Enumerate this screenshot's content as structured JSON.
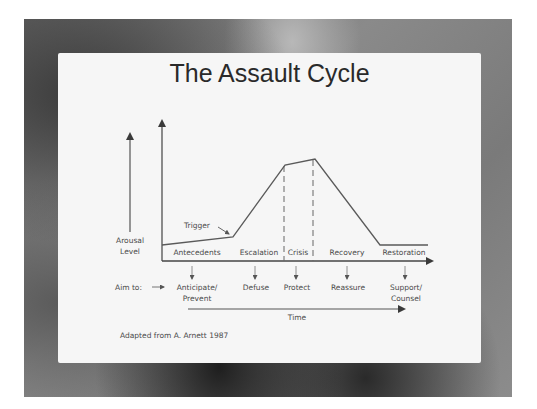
{
  "slide": {
    "title": "The Assault Cycle",
    "source_note": "Adapted from A. Arnett 1987"
  },
  "diagram": {
    "y_axis_label_line1": "Arousal",
    "y_axis_label_line2": "Level",
    "trigger_label": "Trigger",
    "phases": [
      "Antecedents",
      "Escalation",
      "Crisis",
      "Recovery",
      "Restoration"
    ],
    "aim_label": "Aim to:",
    "aims": [
      {
        "line1": "Anticipate/",
        "line2": "Prevent"
      },
      {
        "line1": "Defuse",
        "line2": ""
      },
      {
        "line1": "Protect",
        "line2": ""
      },
      {
        "line1": "Reassure",
        "line2": ""
      },
      {
        "line1": "Support/",
        "line2": "Counsel"
      }
    ],
    "time_label": "Time",
    "curve_points": [
      [
        162,
        245
      ],
      [
        233,
        237
      ],
      [
        285,
        165
      ],
      [
        315,
        159
      ],
      [
        380,
        245
      ],
      [
        428,
        245
      ]
    ],
    "colors": {
      "line": "#5a5a5a",
      "text": "#4a4a4a",
      "panel": "#f6f6f6"
    }
  }
}
